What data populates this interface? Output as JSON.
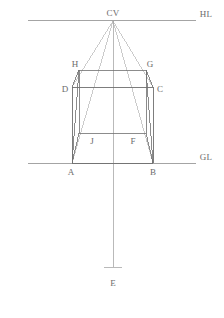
{
  "figure": {
    "canvas": {
      "width": 224,
      "height": 318,
      "background": "#ffffff"
    },
    "stroke": {
      "reference_line_color": "#9a9a9a",
      "solid_edge_color": "#6f6f6f",
      "construction_line_color": "#b5b5b5",
      "axis_color": "#a8a8a8",
      "width": 0.8
    },
    "label_color": "#6b6b6b",
    "label_font_size_px": 9
  },
  "labels": [
    {
      "id": "CV",
      "text": "CV",
      "x": 113,
      "y": 13,
      "anchor": "center",
      "name": "label-cv"
    },
    {
      "id": "HL",
      "text": "HL",
      "x": 206,
      "y": 14,
      "anchor": "center",
      "name": "label-hl"
    },
    {
      "id": "GL",
      "text": "GL",
      "x": 206,
      "y": 157,
      "anchor": "center",
      "name": "label-gl"
    },
    {
      "id": "H",
      "text": "H",
      "x": 75,
      "y": 64,
      "anchor": "center",
      "name": "label-h"
    },
    {
      "id": "G",
      "text": "G",
      "x": 150,
      "y": 64,
      "anchor": "center",
      "name": "label-g"
    },
    {
      "id": "D",
      "text": "D",
      "x": 65,
      "y": 89,
      "anchor": "center",
      "name": "label-d"
    },
    {
      "id": "C",
      "text": "C",
      "x": 160,
      "y": 89,
      "anchor": "center",
      "name": "label-c"
    },
    {
      "id": "J",
      "text": "J",
      "x": 92,
      "y": 141,
      "anchor": "center",
      "name": "label-j"
    },
    {
      "id": "F",
      "text": "F",
      "x": 133,
      "y": 141,
      "anchor": "center",
      "name": "label-f"
    },
    {
      "id": "A",
      "text": "A",
      "x": 71,
      "y": 172,
      "anchor": "center",
      "name": "label-a"
    },
    {
      "id": "B",
      "text": "B",
      "x": 153,
      "y": 172,
      "anchor": "center",
      "name": "label-b"
    },
    {
      "id": "E",
      "text": "E",
      "x": 113,
      "y": 283,
      "anchor": "center",
      "name": "label-e"
    }
  ],
  "points": {
    "CV": {
      "x": 113,
      "y": 21
    },
    "A": {
      "x": 72,
      "y": 163
    },
    "B": {
      "x": 153,
      "y": 163
    },
    "C": {
      "x": 153,
      "y": 87
    },
    "D": {
      "x": 72,
      "y": 87
    },
    "H": {
      "x": 79,
      "y": 70
    },
    "G": {
      "x": 146,
      "y": 70
    },
    "J": {
      "x": 79,
      "y": 133
    },
    "F": {
      "x": 146,
      "y": 133
    },
    "E": {
      "x": 113,
      "y": 267
    }
  },
  "reference_lines": [
    {
      "name": "horizon-line",
      "id": "HL",
      "x1": 28,
      "y1": 20,
      "x2": 196,
      "y2": 20
    },
    {
      "name": "ground-line",
      "id": "GL",
      "x1": 28,
      "y1": 163,
      "x2": 196,
      "y2": 163
    }
  ],
  "front_face": {
    "name": "front-face-abcd",
    "vertices": [
      "A",
      "B",
      "C",
      "D"
    ],
    "edges": [
      {
        "name": "edge-ab",
        "from": "A",
        "to": "B"
      },
      {
        "name": "edge-bc",
        "from": "B",
        "to": "C"
      },
      {
        "name": "edge-cd",
        "from": "C",
        "to": "D"
      },
      {
        "name": "edge-da",
        "from": "D",
        "to": "A"
      }
    ]
  },
  "back_face": {
    "name": "back-face-jfgh",
    "vertices": [
      "J",
      "F",
      "G",
      "H"
    ],
    "edges": [
      {
        "name": "edge-jf",
        "from": "J",
        "to": "F"
      },
      {
        "name": "edge-fg",
        "from": "F",
        "to": "G"
      },
      {
        "name": "edge-gh",
        "from": "G",
        "to": "H"
      },
      {
        "name": "edge-hj",
        "from": "H",
        "to": "J"
      }
    ]
  },
  "receding_edges": [
    {
      "name": "edge-ah",
      "from": "A",
      "to": "H"
    },
    {
      "name": "edge-bg",
      "from": "B",
      "to": "G"
    },
    {
      "name": "edge-dh",
      "from": "D",
      "to": "H"
    },
    {
      "name": "edge-cg",
      "from": "C",
      "to": "G"
    },
    {
      "name": "edge-aj",
      "from": "A",
      "to": "J"
    },
    {
      "name": "edge-bf",
      "from": "B",
      "to": "F"
    }
  ],
  "construction_lines": [
    {
      "name": "vanishing-ray-cv-d",
      "from": "CV",
      "to": "D"
    },
    {
      "name": "vanishing-ray-cv-c",
      "from": "CV",
      "to": "C"
    },
    {
      "name": "vanishing-ray-cv-a",
      "from": "CV",
      "to": "A"
    },
    {
      "name": "vanishing-ray-cv-b",
      "from": "CV",
      "to": "B"
    }
  ],
  "axis": {
    "name": "central-axis",
    "x": 113,
    "y_top": 21,
    "y_bottom": 267,
    "tick": {
      "name": "axis-end-tick",
      "x1": 104,
      "x2": 122,
      "y": 267
    }
  }
}
